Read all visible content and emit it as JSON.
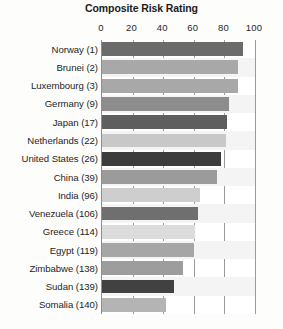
{
  "chart_data": {
    "type": "bar",
    "orientation": "horizontal",
    "title": "Composite Risk Rating",
    "xlabel": "",
    "ylabel": "",
    "xlim": [
      0,
      100
    ],
    "xticks": [
      0,
      20,
      40,
      60,
      80,
      100
    ],
    "xtick_labels": [
      "0",
      "20",
      "40",
      "60",
      "80",
      "100"
    ],
    "grid": true,
    "legend": "none",
    "categories": [
      "Norway (1)",
      "Brunei (2)",
      "Luxembourg (3)",
      "Germany (9)",
      "Japan (17)",
      "Netherlands (22)",
      "United States (26)",
      "China (39)",
      "India (96)",
      "Venezuela (106)",
      "Greece (114)",
      "Egypt (119)",
      "Zimbabwe (138)",
      "Sudan (139)",
      "Somalia (140)"
    ],
    "values": [
      92,
      89,
      89,
      83,
      82,
      81,
      78,
      75,
      64,
      63,
      61,
      60,
      53,
      47,
      42
    ],
    "bar_colors": [
      "#6b6b6b",
      "#a8a8a8",
      "#a8a8a8",
      "#8c8c8c",
      "#5e5e5e",
      "#c8c8c8",
      "#3c3c3c",
      "#9b9b9b",
      "#cecece",
      "#6f6f6f",
      "#dcdcdc",
      "#a6a6a6",
      "#9d9d9d",
      "#414141",
      "#b4b4b4"
    ]
  },
  "colors": {
    "background": "#fdfdfc",
    "plot_background": "#ffffff",
    "gridline": "#9a9a9a",
    "alt_row": "#f4f4f4",
    "text": "#1e1e1e"
  }
}
